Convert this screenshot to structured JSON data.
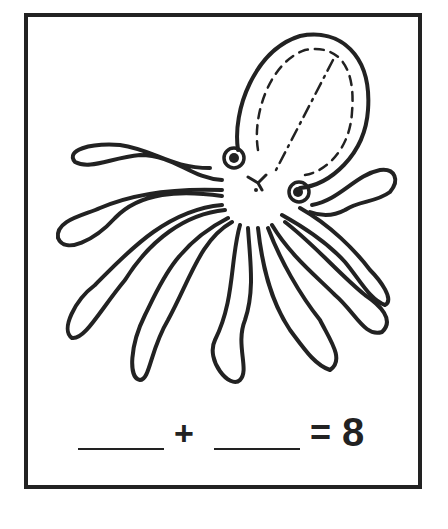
{
  "worksheet": {
    "subject": "octopus",
    "illustration_alt": "Octopus with 8 tentacles, dashed tracing lines on head",
    "equation": {
      "blank_1": "",
      "plus": "+",
      "blank_2": "",
      "equals": "=",
      "total": "8"
    },
    "colors": {
      "ink": "#222222",
      "paper": "#ffffff"
    }
  }
}
